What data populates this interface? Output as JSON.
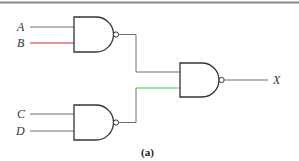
{
  "diagram": {
    "type": "logic-circuit",
    "caption": "(a)",
    "inputs": [
      {
        "name": "A",
        "wire_color": "#6e6e6e"
      },
      {
        "name": "B",
        "wire_color": "#d9262c"
      },
      {
        "name": "C",
        "wire_color": "#6e6e6e"
      },
      {
        "name": "D",
        "wire_color": "#6e6e6e"
      }
    ],
    "output": {
      "name": "X"
    },
    "gates": [
      {
        "id": "g1",
        "type": "NAND",
        "inputs": [
          "A",
          "B"
        ]
      },
      {
        "id": "g2",
        "type": "NAND",
        "inputs": [
          "C",
          "D"
        ]
      },
      {
        "id": "g3",
        "type": "NAND",
        "inputs": [
          "g1",
          "g2"
        ],
        "output": "X"
      }
    ],
    "colors": {
      "gate_stroke": "#333333",
      "wire": "#6e6e6e",
      "highlight_red": "#d9262c",
      "highlight_green": "#3ecf4a",
      "top_rule": "#8a8a8a"
    }
  }
}
